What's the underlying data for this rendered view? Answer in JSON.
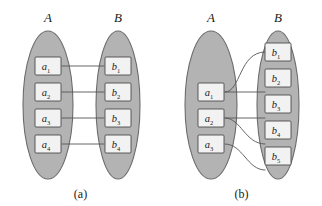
{
  "figure": {
    "width": 322,
    "height": 206,
    "background": "#ffffff",
    "ellipse_fill": "#b3b3b3",
    "ellipse_stroke": "#6b6b6b",
    "box_fill": "#f2f2f2",
    "box_stroke": "#4a4a4a",
    "edge_color": "#555555",
    "text_color": "#1a1a1a"
  },
  "panels": [
    {
      "id": "a",
      "caption": "(a)",
      "left_set": {
        "label": "A",
        "nodes": [
          {
            "base": "a",
            "sub": "1",
            "text": "a1"
          },
          {
            "base": "a",
            "sub": "2",
            "text": "a2"
          },
          {
            "base": "a",
            "sub": "3",
            "text": "a3"
          },
          {
            "base": "a",
            "sub": "4",
            "text": "a4"
          }
        ]
      },
      "right_set": {
        "label": "B",
        "nodes": [
          {
            "base": "b",
            "sub": "1",
            "text": "b1"
          },
          {
            "base": "b",
            "sub": "2",
            "text": "b2"
          },
          {
            "base": "b",
            "sub": "3",
            "text": "b3"
          },
          {
            "base": "b",
            "sub": "4",
            "text": "b4"
          }
        ]
      },
      "edges": [
        {
          "from": "a1",
          "to": "b1",
          "style": "straight"
        },
        {
          "from": "a2",
          "to": "b2",
          "style": "straight"
        },
        {
          "from": "a3",
          "to": "b3",
          "style": "straight"
        },
        {
          "from": "a4",
          "to": "b4",
          "style": "straight"
        }
      ]
    },
    {
      "id": "b",
      "caption": "(b)",
      "left_set": {
        "label": "A",
        "nodes": [
          {
            "base": "a",
            "sub": "1",
            "text": "a1"
          },
          {
            "base": "a",
            "sub": "2",
            "text": "a2"
          },
          {
            "base": "a",
            "sub": "3",
            "text": "a3"
          }
        ]
      },
      "right_set": {
        "label": "B",
        "nodes": [
          {
            "base": "b",
            "sub": "1",
            "text": "b1"
          },
          {
            "base": "b",
            "sub": "2",
            "text": "b2"
          },
          {
            "base": "b",
            "sub": "3",
            "text": "b3"
          },
          {
            "base": "b",
            "sub": "4",
            "text": "b4"
          },
          {
            "base": "b",
            "sub": "5",
            "text": "b5"
          }
        ]
      },
      "edges": [
        {
          "from": "a1",
          "to": "b1",
          "style": "curve-up"
        },
        {
          "from": "a1",
          "to": "b2",
          "style": "straight"
        },
        {
          "from": "a2",
          "to": "b3",
          "style": "straight"
        },
        {
          "from": "a2",
          "to": "b4",
          "style": "curve-down"
        },
        {
          "from": "a3",
          "to": "b5",
          "style": "curve-down"
        }
      ]
    }
  ]
}
